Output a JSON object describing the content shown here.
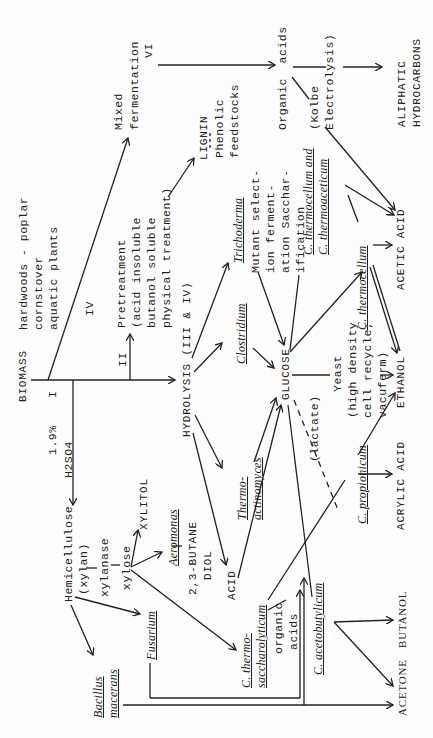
{
  "diagram": {
    "orientation": "rotated 90° counter-clockwise",
    "nodes": {
      "biomass": "BIOMASS",
      "biomass_sources": [
        "hardwoods - poplar",
        "cornstover",
        "aquatic plants"
      ],
      "route_I": "I",
      "route_II": "II",
      "route_IV": "IV",
      "acid_label_1": "1.9%",
      "acid_label_2": "H2SO4",
      "pretreatment": [
        "Pretreatment",
        "(acid insoluble",
        "butanol soluble",
        "physical treatment)"
      ],
      "lignin": "LIGNIN",
      "phenolic": [
        "Phenolic",
        "feedstocks"
      ],
      "mixed_fermentation": [
        "Mixed",
        "fermentation"
      ],
      "route_VI": "VI",
      "organic_acids_top": "Organic  acids",
      "kolbe": [
        "(Kolbe",
        "Electrolysis)"
      ],
      "aliphatic": [
        "ALIPHATIC",
        "HYDROCARBONS"
      ],
      "hydrolysis": "HYDROLYSIS (III & IV)",
      "trichoderma": "Trichoderma",
      "mutant": [
        "Mutant select-",
        "ion ferment-",
        "ation Sacchar-",
        "ification"
      ],
      "clostridium": "Clostridium",
      "thermoactinomyces": [
        "Thermo-",
        "actinomyces"
      ],
      "glucose": "GLUCOSE",
      "c_thermocellum_and": "C. thermocellum and",
      "c_thermoaceticum": "C. thermoaceticum",
      "c_thermocellum": "C. thermocellum",
      "acetic_acid": "ACETIC ACID",
      "yeast": [
        "Yeast",
        "(high density",
        "cell recycle;",
        "vacuferm)"
      ],
      "ethanol": "ETHANOL",
      "lactate": "(lactate)",
      "c_propionicum": "C. propionicum",
      "acrylic_acid": "ACRYLIC ACID",
      "acid": "ACID",
      "hemicellulose": [
        "Hemicellulose",
        "(xylan)"
      ],
      "xylanase": "xylanase",
      "xylose": "xylose",
      "xylitol": "XYLITOL",
      "aeromonas": "Aeromonas",
      "butanediol": [
        "2,3-BUTANE",
        "DIOL"
      ],
      "fusarium": "Fusarium",
      "bacillus": [
        "Bacillus",
        "macerans"
      ],
      "c_thermosaccharolyticum": [
        "C. thermo-",
        "saccharolyticum"
      ],
      "organic_acids_bottom": [
        "organic",
        "acids"
      ],
      "c_acetobutylicum": "C. acetobutylicum",
      "butanol": "BUTANOL",
      "acetone": "ACETONE"
    }
  }
}
